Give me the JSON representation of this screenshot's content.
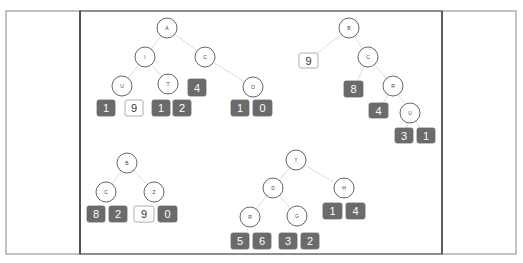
{
  "colors": {
    "frame": "#444444",
    "frame_light": "#9a9a9a",
    "node_stroke": "#555555",
    "edge": "#dddddd",
    "box_dark": "#6b6b6b",
    "box_dark_text": "#ffffff",
    "box_light_fill": "#ffffff",
    "box_light_stroke": "#999999",
    "box_light_text": "#333333"
  },
  "layout": {
    "panels": [
      {
        "name": "left-panel",
        "x": 6,
        "y": 11,
        "w": 74,
        "h": 243
      },
      {
        "name": "center-panel",
        "x": 80,
        "y": 11,
        "w": 362,
        "h": 243
      },
      {
        "name": "right-panel",
        "x": 442,
        "y": 11,
        "w": 74,
        "h": 243
      }
    ]
  },
  "trees": [
    {
      "name": "tree-a",
      "nodes": [
        {
          "id": "A",
          "label": "A",
          "x": 167,
          "y": 28
        },
        {
          "id": "I",
          "label": "I",
          "x": 145,
          "y": 57
        },
        {
          "id": "C",
          "label": "C",
          "x": 205,
          "y": 57
        },
        {
          "id": "U",
          "label": "U",
          "x": 122,
          "y": 86
        },
        {
          "id": "T",
          "label": "T",
          "x": 168,
          "y": 84
        },
        {
          "id": "O",
          "label": "O",
          "x": 253,
          "y": 87
        }
      ],
      "edges": [
        [
          "A",
          "I"
        ],
        [
          "A",
          "C"
        ],
        [
          "I",
          "U"
        ],
        [
          "I",
          "T"
        ],
        [
          "C",
          "O"
        ]
      ],
      "boxes": [
        {
          "label": "4",
          "x": 188,
          "y": 79,
          "w": 18,
          "h": 17,
          "style": "dark"
        },
        {
          "label": "1",
          "x": 97,
          "y": 100,
          "w": 18,
          "h": 16,
          "style": "dark"
        },
        {
          "label": "9",
          "x": 125,
          "y": 100,
          "w": 18,
          "h": 16,
          "style": "light"
        },
        {
          "label": "1",
          "x": 152,
          "y": 100,
          "w": 18,
          "h": 16,
          "style": "dark"
        },
        {
          "label": "2",
          "x": 173,
          "y": 100,
          "w": 18,
          "h": 16,
          "style": "dark"
        },
        {
          "label": "1",
          "x": 231,
          "y": 100,
          "w": 18,
          "h": 16,
          "style": "dark"
        },
        {
          "label": "0",
          "x": 253,
          "y": 100,
          "w": 19,
          "h": 16,
          "style": "dark"
        }
      ]
    },
    {
      "name": "tree-b",
      "nodes": [
        {
          "id": "B",
          "label": "B",
          "x": 349,
          "y": 28
        },
        {
          "id": "C",
          "label": "C",
          "x": 368,
          "y": 57
        },
        {
          "id": "R",
          "label": "R",
          "x": 393,
          "y": 86
        },
        {
          "id": "U",
          "label": "U",
          "x": 410,
          "y": 113
        }
      ],
      "edges": [
        [
          "B",
          "C"
        ],
        [
          "C",
          "R"
        ],
        [
          "R",
          "U"
        ]
      ],
      "extra_edges": [
        [
          349,
          28,
          309,
          60
        ],
        [
          368,
          57,
          354,
          89
        ],
        [
          393,
          86,
          379,
          110
        ],
        [
          410,
          113,
          404,
          135
        ],
        [
          410,
          113,
          425,
          135
        ]
      ],
      "boxes": [
        {
          "label": "9",
          "x": 299,
          "y": 53,
          "w": 19,
          "h": 15,
          "style": "light"
        },
        {
          "label": "8",
          "x": 344,
          "y": 81,
          "w": 19,
          "h": 16,
          "style": "dark"
        },
        {
          "label": "4",
          "x": 369,
          "y": 103,
          "w": 19,
          "h": 15,
          "style": "dark"
        },
        {
          "label": "3",
          "x": 395,
          "y": 128,
          "w": 18,
          "h": 15,
          "style": "dark"
        },
        {
          "label": "1",
          "x": 417,
          "y": 128,
          "w": 18,
          "h": 15,
          "style": "dark"
        }
      ]
    },
    {
      "name": "tree-b2",
      "nodes": [
        {
          "id": "B",
          "label": "B",
          "x": 127,
          "y": 163
        },
        {
          "id": "C",
          "label": "C",
          "x": 106,
          "y": 192
        },
        {
          "id": "Z",
          "label": "Z",
          "x": 154,
          "y": 192
        }
      ],
      "edges": [
        [
          "B",
          "C"
        ],
        [
          "B",
          "Z"
        ]
      ],
      "boxes": [
        {
          "label": "8",
          "x": 87,
          "y": 206,
          "w": 18,
          "h": 16,
          "style": "dark"
        },
        {
          "label": "2",
          "x": 109,
          "y": 206,
          "w": 18,
          "h": 16,
          "style": "dark"
        },
        {
          "label": "9",
          "x": 134,
          "y": 206,
          "w": 20,
          "h": 16,
          "style": "light"
        },
        {
          "label": "0",
          "x": 158,
          "y": 206,
          "w": 19,
          "h": 16,
          "style": "dark"
        }
      ]
    },
    {
      "name": "tree-y",
      "nodes": [
        {
          "id": "Y",
          "label": "Y",
          "x": 296,
          "y": 160
        },
        {
          "id": "D",
          "label": "D",
          "x": 273,
          "y": 188
        },
        {
          "id": "H",
          "label": "H",
          "x": 344,
          "y": 188
        },
        {
          "id": "R",
          "label": "R",
          "x": 250,
          "y": 217
        },
        {
          "id": "G",
          "label": "G",
          "x": 297,
          "y": 216
        }
      ],
      "edges": [
        [
          "Y",
          "D"
        ],
        [
          "Y",
          "H"
        ],
        [
          "D",
          "R"
        ],
        [
          "D",
          "G"
        ]
      ],
      "boxes": [
        {
          "label": "1",
          "x": 323,
          "y": 203,
          "w": 19,
          "h": 16,
          "style": "dark"
        },
        {
          "label": "4",
          "x": 346,
          "y": 203,
          "w": 19,
          "h": 16,
          "style": "dark"
        },
        {
          "label": "5",
          "x": 231,
          "y": 233,
          "w": 18,
          "h": 16,
          "style": "dark"
        },
        {
          "label": "6",
          "x": 253,
          "y": 233,
          "w": 18,
          "h": 16,
          "style": "dark"
        },
        {
          "label": "3",
          "x": 279,
          "y": 233,
          "w": 18,
          "h": 16,
          "style": "dark"
        },
        {
          "label": "2",
          "x": 301,
          "y": 233,
          "w": 18,
          "h": 16,
          "style": "dark"
        }
      ]
    }
  ]
}
